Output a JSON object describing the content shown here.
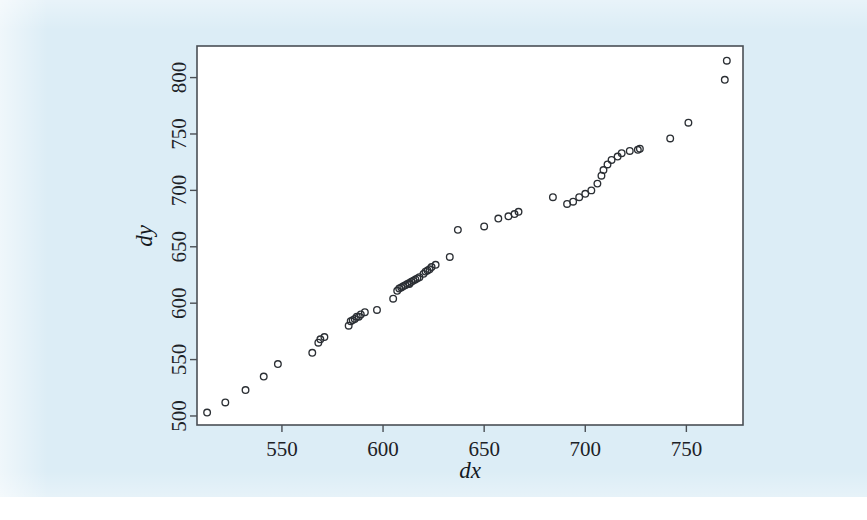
{
  "page": {
    "background_color": "#dcedf6",
    "paper_color": "#ffffff"
  },
  "figure": {
    "plot_background": "#ffffff",
    "frame_color": "#4a4f55",
    "marker_color": "#2b2f34",
    "marker_style": "open-circle"
  },
  "chart_data": {
    "type": "scatter",
    "title": "",
    "xlabel": "dx",
    "ylabel": "dy",
    "xlim": [
      508,
      778
    ],
    "ylim": [
      492,
      828
    ],
    "xticks": [
      550,
      600,
      650,
      700,
      750
    ],
    "yticks": [
      500,
      550,
      600,
      650,
      700,
      750,
      800
    ],
    "xtick_labels": [
      "550",
      "600",
      "650",
      "700",
      "750"
    ],
    "ytick_labels": [
      "500",
      "550",
      "600",
      "650",
      "700",
      "750",
      "800"
    ],
    "ytick_label_rotation": -90,
    "grid": false,
    "legend": null,
    "marker": "o",
    "marker_size": 4,
    "n_points": 64,
    "x": [
      513,
      522,
      532,
      541,
      548,
      565,
      568,
      569,
      571,
      583,
      584,
      585,
      586,
      587,
      588,
      589,
      591,
      597,
      605,
      607,
      608,
      609,
      610,
      611,
      612,
      613,
      613,
      614,
      615,
      616,
      617,
      618,
      620,
      621,
      622,
      623,
      624,
      626,
      633,
      637,
      650,
      657,
      662,
      665,
      667,
      684,
      691,
      694,
      697,
      700,
      703,
      706,
      708,
      709,
      711,
      713,
      716,
      718,
      722,
      726,
      727,
      742,
      751,
      769
    ],
    "y": [
      503,
      512,
      523,
      535,
      546,
      556,
      565,
      568,
      570,
      580,
      584,
      585,
      586,
      588,
      588,
      590,
      592,
      594,
      604,
      611,
      613,
      614,
      615,
      616,
      617,
      617,
      618,
      619,
      620,
      621,
      622,
      623,
      626,
      628,
      629,
      630,
      632,
      634,
      641,
      665,
      668,
      675,
      677,
      679,
      681,
      694,
      688,
      690,
      694,
      697,
      700,
      706,
      713,
      718,
      723,
      727,
      730,
      733,
      735,
      736,
      737,
      746,
      760,
      798
    ],
    "extra_points": {
      "x": [
        770
      ],
      "y": [
        815
      ]
    }
  }
}
